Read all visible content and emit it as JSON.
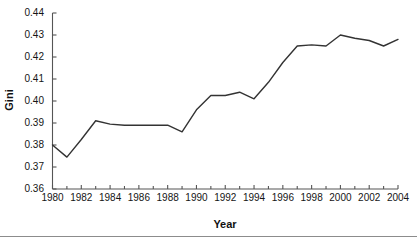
{
  "chart_data": {
    "type": "line",
    "title": "",
    "xlabel": "Year",
    "ylabel": "Gini",
    "xlim": [
      1980,
      2004
    ],
    "ylim": [
      0.36,
      0.44
    ],
    "grid": false,
    "legend": null,
    "line_color": "#333333",
    "axis_color": "#555555",
    "background_color": "#ffffff",
    "x_tick_labels": [
      "1980",
      "1982",
      "1984",
      "1986",
      "1988",
      "1990",
      "1992",
      "1994",
      "1996",
      "1998",
      "2000",
      "2002",
      "2004"
    ],
    "x_tick_values": [
      1980,
      1982,
      1984,
      1986,
      1988,
      1990,
      1992,
      1994,
      1996,
      1998,
      2000,
      2002,
      2004
    ],
    "x_minor_ticks": [
      1981,
      1983,
      1985,
      1987,
      1989,
      1991,
      1993,
      1995,
      1997,
      1999,
      2001,
      2003
    ],
    "y_tick_labels": [
      "0.36",
      "0.37",
      "0.38",
      "0.39",
      "0.40",
      "0.41",
      "0.42",
      "0.43",
      "0.44"
    ],
    "y_tick_values": [
      0.36,
      0.37,
      0.38,
      0.39,
      0.4,
      0.41,
      0.42,
      0.43,
      0.44
    ],
    "x": [
      1980,
      1981,
      1982,
      1983,
      1984,
      1985,
      1986,
      1987,
      1988,
      1989,
      1990,
      1991,
      1992,
      1993,
      1994,
      1995,
      1996,
      1997,
      1998,
      1999,
      2000,
      2001,
      2002,
      2003,
      2004
    ],
    "values": [
      0.38,
      0.3745,
      0.3825,
      0.391,
      0.3895,
      0.389,
      0.389,
      0.389,
      0.389,
      0.386,
      0.396,
      0.4025,
      0.4025,
      0.404,
      0.401,
      0.4085,
      0.4175,
      0.425,
      0.4255,
      0.425,
      0.43,
      0.4285,
      0.4275,
      0.425,
      0.428
    ],
    "series": [
      {
        "name": "Gini",
        "values": [
          0.38,
          0.3745,
          0.3825,
          0.391,
          0.3895,
          0.389,
          0.389,
          0.389,
          0.389,
          0.386,
          0.396,
          0.4025,
          0.4025,
          0.404,
          0.401,
          0.4085,
          0.4175,
          0.425,
          0.4255,
          0.425,
          0.43,
          0.4285,
          0.4275,
          0.425,
          0.428
        ]
      }
    ]
  }
}
